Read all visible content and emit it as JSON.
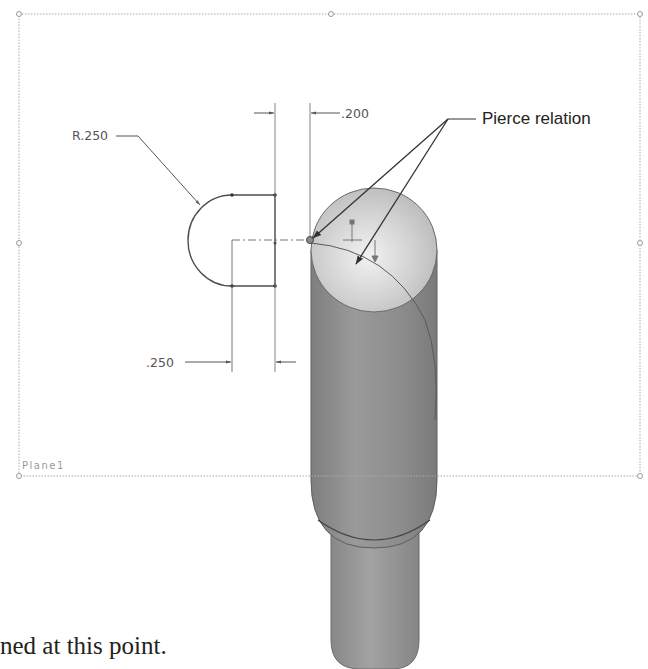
{
  "figure": {
    "plane": {
      "label": "Plane1"
    },
    "dimensions": {
      "radius": "R.250",
      "offset_top": ".200",
      "offset_bottom": ".250"
    },
    "callout": {
      "label": "Pierce relation"
    },
    "colors": {
      "background": "#ffffff",
      "plane_border": "#b0b0b0",
      "sketch_line": "#555555",
      "cylinder_body": "#8e8e8e",
      "cylinder_top_face": "#c9c9c9",
      "callout_text": "#222222"
    }
  },
  "caption": {
    "text": "ned at this point."
  }
}
